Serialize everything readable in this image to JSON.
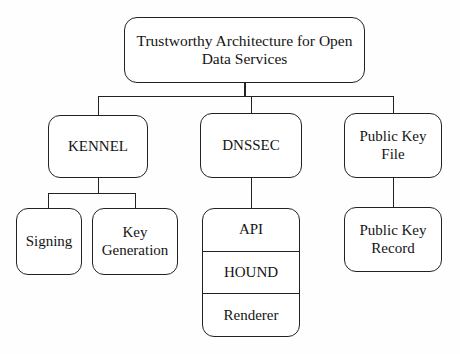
{
  "diagram": {
    "title": "Trustworthy Architecture for Open Data Services",
    "type": "hierarchy-tree",
    "style": {
      "background_color": "#ffffff",
      "box_fill": "#ffffff",
      "line_color": "#222222",
      "text_color": "#141414",
      "box_shape": "rounded-rectangle"
    },
    "nodes": {
      "root": {
        "label": "Trustworthy Architecture for Open\nData Services",
        "level": 0
      },
      "kennel": {
        "label": "KENNEL",
        "level": 1
      },
      "dnssec": {
        "label": "DNSSEC",
        "level": 1
      },
      "public_key_file": {
        "label": "Public Key\nFile",
        "level": 1
      },
      "signing": {
        "label": "Signing",
        "level": 2
      },
      "key_generation": {
        "label": "Key\nGeneration",
        "level": 2
      },
      "public_key_record": {
        "label": "Public Key\nRecord",
        "level": 2
      },
      "dnssec_stack": {
        "level": 2,
        "segments": [
          {
            "label": "API"
          },
          {
            "label": "HOUND"
          },
          {
            "label": "Renderer"
          }
        ]
      }
    },
    "edges": [
      {
        "from": "root",
        "to": "kennel"
      },
      {
        "from": "root",
        "to": "dnssec"
      },
      {
        "from": "root",
        "to": "public_key_file"
      },
      {
        "from": "kennel",
        "to": "signing"
      },
      {
        "from": "kennel",
        "to": "key_generation"
      },
      {
        "from": "dnssec",
        "to": "dnssec_stack"
      },
      {
        "from": "public_key_file",
        "to": "public_key_record"
      }
    ]
  }
}
